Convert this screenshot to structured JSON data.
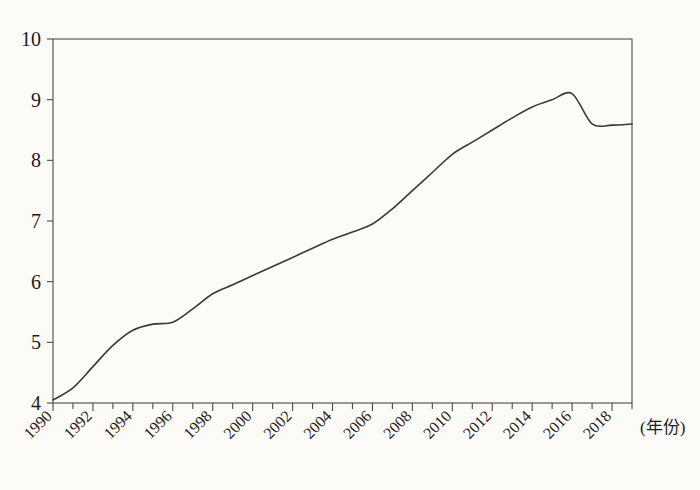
{
  "chart_data": {
    "type": "line",
    "title": "",
    "subtitle": "",
    "xlabel": "(年份)",
    "ylabel": "",
    "xlim": [
      1990,
      2019
    ],
    "ylim": [
      4,
      10
    ],
    "grid": false,
    "legend": null,
    "y_ticks": [
      4,
      5,
      6,
      7,
      8,
      9,
      10
    ],
    "y_tick_labels": [
      "4",
      "5",
      "6",
      "7",
      "8",
      "9",
      "10"
    ],
    "x_ticks": [
      1990,
      1992,
      1994,
      1996,
      1998,
      2000,
      2002,
      2004,
      2006,
      2008,
      2010,
      2012,
      2014,
      2016,
      2018
    ],
    "x_tick_labels": [
      "1990",
      "1992",
      "1994",
      "1996",
      "1998",
      "2000",
      "2002",
      "2004",
      "2006",
      "2008",
      "2010",
      "2012",
      "2014",
      "2016",
      "2018"
    ],
    "x_minor_tick_step": 1,
    "line_color": "#3a3a3a",
    "frame_color": "#4a4a4a",
    "series": [
      {
        "name": "value",
        "x": [
          1990,
          1991,
          1992,
          1993,
          1994,
          1995,
          1996,
          1997,
          1998,
          1999,
          2000,
          2001,
          2002,
          2003,
          2004,
          2005,
          2006,
          2007,
          2008,
          2009,
          2010,
          2011,
          2012,
          2013,
          2014,
          2015,
          2016,
          2017,
          2018,
          2019
        ],
        "values": [
          4.05,
          4.25,
          4.6,
          4.95,
          5.2,
          5.3,
          5.33,
          5.55,
          5.8,
          5.95,
          6.1,
          6.25,
          6.4,
          6.55,
          6.7,
          6.82,
          6.95,
          7.2,
          7.5,
          7.8,
          8.1,
          8.3,
          8.5,
          8.7,
          8.88,
          9.0,
          9.1,
          8.6,
          8.58,
          8.6
        ]
      }
    ]
  },
  "axis": {
    "x_caption": "(年份)"
  }
}
